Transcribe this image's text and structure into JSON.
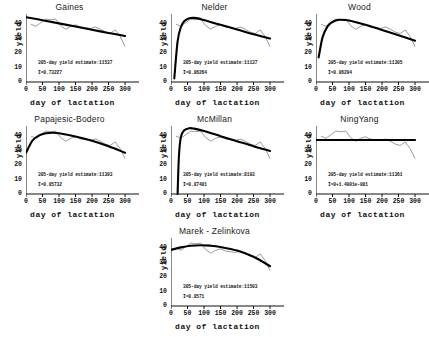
{
  "figure": {
    "axis_labels": {
      "x": "day of lactation",
      "y": "yield"
    },
    "xticks": [
      "0",
      "50",
      "100",
      "150",
      "200",
      "250",
      "300"
    ],
    "yticks": [
      "0",
      "10",
      "20",
      "30",
      "40"
    ],
    "estimate_prefix": "305-day yield estimate:",
    "r_prefix": "I="
  },
  "chart_data": {
    "type": "line",
    "title": "",
    "xlabel": "day of lactation",
    "ylabel": "yield",
    "xlim": [
      0,
      315
    ],
    "ylim": [
      0,
      47
    ],
    "xticks": [
      0,
      50,
      100,
      150,
      200,
      250,
      300
    ],
    "yticks": [
      0,
      10,
      20,
      30,
      40
    ],
    "grid": false,
    "legend": "none",
    "observed_series": {
      "name": "observed yield",
      "color": "#808080",
      "x": [
        15,
        30,
        45,
        60,
        75,
        90,
        105,
        120,
        135,
        150,
        165,
        180,
        195,
        210,
        225,
        240,
        255,
        270,
        285,
        300
      ],
      "y": [
        40.0,
        38.5,
        41.0,
        43.5,
        43.0,
        43.5,
        39.0,
        36.5,
        38.5,
        39.5,
        38.0,
        37.5,
        37.0,
        38.0,
        36.5,
        34.5,
        33.5,
        36.0,
        31.5,
        24.5
      ]
    },
    "panels": [
      {
        "id": "gaines",
        "title": "Gaines",
        "estimate": "11537",
        "r_value": "0.73227",
        "fit_type": "linear-decline",
        "fit_color": "#000000",
        "fit_x": [
          0,
          50,
          100,
          150,
          200,
          250,
          300
        ],
        "fit_y": [
          44.8,
          42.7,
          40.5,
          38.3,
          36.1,
          33.9,
          31.8
        ]
      },
      {
        "id": "nelder",
        "title": "Nelder",
        "estimate": "11137",
        "r_value": "0.86264",
        "fit_type": "sharp-rise-decline",
        "fit_color": "#000000",
        "fit_x": [
          10,
          20,
          30,
          40,
          55,
          70,
          85,
          100,
          150,
          200,
          250,
          300
        ],
        "fit_y": [
          2.5,
          28.0,
          38.0,
          42.0,
          44.0,
          44.3,
          43.8,
          42.8,
          39.5,
          36.3,
          33.0,
          30.0
        ]
      },
      {
        "id": "wood",
        "title": "Wood",
        "estimate": "11305",
        "r_value": "0.86294",
        "fit_type": "sharp-rise-decline",
        "fit_color": "#000000",
        "fit_x": [
          8,
          20,
          35,
          50,
          70,
          90,
          110,
          150,
          200,
          250,
          300
        ],
        "fit_y": [
          17.0,
          31.0,
          38.5,
          41.5,
          43.0,
          42.8,
          42.0,
          39.5,
          36.0,
          32.3,
          28.5
        ]
      },
      {
        "id": "papajesic-bodero",
        "title": "Papajesic-Bodero",
        "estimate": "11393",
        "r_value": "0.85732",
        "fit_type": "dome",
        "fit_color": "#000000",
        "fit_x": [
          0,
          20,
          40,
          60,
          80,
          100,
          150,
          200,
          250,
          300
        ],
        "fit_y": [
          28.5,
          37.0,
          40.5,
          42.0,
          42.3,
          42.0,
          39.8,
          36.8,
          33.0,
          28.5
        ]
      },
      {
        "id": "mcmillan",
        "title": "McMillan",
        "estimate": "8193",
        "r_value": "0.87481",
        "fit_type": "vertical-rise-decline",
        "fit_color": "#000000",
        "fit_x": [
          20,
          24,
          30,
          40,
          55,
          70,
          100,
          150,
          200,
          250,
          300
        ],
        "fit_y": [
          0.0,
          26.0,
          39.5,
          44.0,
          45.5,
          45.2,
          43.5,
          40.0,
          36.5,
          33.0,
          29.8
        ]
      },
      {
        "id": "ningyang",
        "title": "NingYang",
        "estimate": "11361",
        "r_value": "0+1.4901e-081",
        "fit_type": "flat",
        "fit_color": "#000000",
        "fit_x": [
          0,
          300
        ],
        "fit_y": [
          37.3,
          37.3
        ]
      },
      {
        "id": "marek-zelinkova",
        "title": "Marek - Zelinkova",
        "estimate": "11503",
        "r_value": "0.8571",
        "fit_type": "dome",
        "fit_color": "#000000",
        "fit_x": [
          0,
          30,
          60,
          90,
          120,
          150,
          200,
          250,
          300
        ],
        "fit_y": [
          38.8,
          40.5,
          41.7,
          42.0,
          41.7,
          40.8,
          38.3,
          34.0,
          27.5
        ]
      }
    ]
  }
}
